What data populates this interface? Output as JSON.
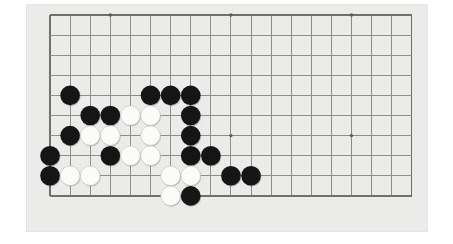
{
  "app": {
    "title": "Go Board Position",
    "board_type": "go-goban",
    "description": "Partial view of a 19x19 Go board showing the lower-left region of a game position"
  },
  "colors": {
    "page_background": "#ffffff",
    "board_background": "#eeeeec",
    "grid_line": "#8d8d8a",
    "grid_edge": "#6f6f6c",
    "star_point": "#5c5c59",
    "black_stone": "#151515",
    "white_stone": "#fbfbf9",
    "white_stone_outline": "#c9c9c4"
  },
  "board": {
    "mat": {
      "x": 26,
      "y": 4,
      "width": 402,
      "height": 228
    },
    "origin_x": 50,
    "origin_y": 15,
    "cell": 20.1,
    "columns": 19,
    "rows": 11,
    "visible_cols": 19,
    "visible_rows": 10,
    "stone_radius": 9.8,
    "star_points": [
      {
        "col": 3,
        "row": 0,
        "name": "hoshi-top-left"
      },
      {
        "col": 9,
        "row": 0,
        "name": "hoshi-top-center"
      },
      {
        "col": 15,
        "row": 0,
        "name": "hoshi-top-right"
      },
      {
        "col": 9,
        "row": 6,
        "name": "hoshi-center"
      },
      {
        "col": 15,
        "row": 6,
        "name": "hoshi-right"
      }
    ],
    "stones": [
      {
        "col": 1,
        "row": 4,
        "color": "black"
      },
      {
        "col": 5,
        "row": 4,
        "color": "black"
      },
      {
        "col": 6,
        "row": 4,
        "color": "black"
      },
      {
        "col": 7,
        "row": 4,
        "color": "black"
      },
      {
        "col": 2,
        "row": 5,
        "color": "black"
      },
      {
        "col": 3,
        "row": 5,
        "color": "black"
      },
      {
        "col": 4,
        "row": 5,
        "color": "white"
      },
      {
        "col": 5,
        "row": 5,
        "color": "white"
      },
      {
        "col": 7,
        "row": 5,
        "color": "black"
      },
      {
        "col": 1,
        "row": 6,
        "color": "black"
      },
      {
        "col": 2,
        "row": 6,
        "color": "white"
      },
      {
        "col": 3,
        "row": 6,
        "color": "white"
      },
      {
        "col": 5,
        "row": 6,
        "color": "white"
      },
      {
        "col": 7,
        "row": 6,
        "color": "black"
      },
      {
        "col": 0,
        "row": 7,
        "color": "black"
      },
      {
        "col": 3,
        "row": 7,
        "color": "black"
      },
      {
        "col": 4,
        "row": 7,
        "color": "white"
      },
      {
        "col": 5,
        "row": 7,
        "color": "white"
      },
      {
        "col": 7,
        "row": 7,
        "color": "black"
      },
      {
        "col": 8,
        "row": 7,
        "color": "black"
      },
      {
        "col": 0,
        "row": 8,
        "color": "black"
      },
      {
        "col": 1,
        "row": 8,
        "color": "white"
      },
      {
        "col": 2,
        "row": 8,
        "color": "white"
      },
      {
        "col": 6,
        "row": 8,
        "color": "white"
      },
      {
        "col": 7,
        "row": 8,
        "color": "white"
      },
      {
        "col": 9,
        "row": 8,
        "color": "black"
      },
      {
        "col": 10,
        "row": 8,
        "color": "black"
      },
      {
        "col": 6,
        "row": 9,
        "color": "white"
      },
      {
        "col": 7,
        "row": 9,
        "color": "black"
      }
    ],
    "counts": {
      "black_stones": 17,
      "white_stones": 11,
      "total_stones": 28
    }
  }
}
